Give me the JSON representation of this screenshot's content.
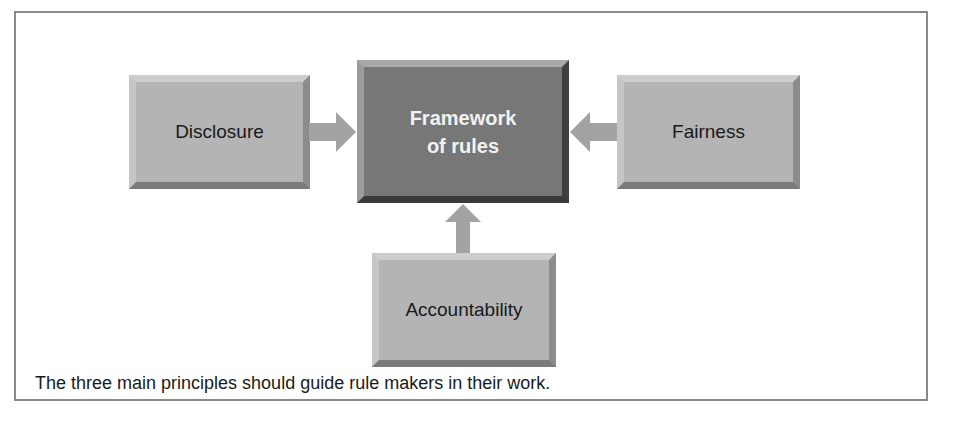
{
  "diagram": {
    "center": {
      "line1": "Framework",
      "line2": "of rules"
    },
    "principles": [
      {
        "label": "Disclosure",
        "position": "left"
      },
      {
        "label": "Fairness",
        "position": "right"
      },
      {
        "label": "Accountability",
        "position": "bottom"
      }
    ],
    "caption": "The three main principles should guide rule makers in their work.",
    "colors": {
      "principle_fill": "#b4b4b4",
      "center_fill": "#777777",
      "arrow_fill": "#a3a3a3",
      "frame_border": "#8a8a8a"
    }
  }
}
